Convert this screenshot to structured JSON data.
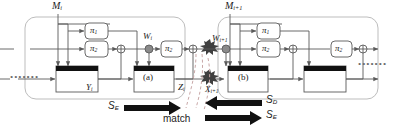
{
  "figure": {
    "type": "block-diagram",
    "colors": {
      "line": "#5a5a5a",
      "block_fill": "#ffffff",
      "block_header": "#1a1a1a",
      "arrow_fill": "#111111",
      "burst": "#3a3a3a",
      "group_border": "#b9b9b9",
      "match_dash": "#c9a7a7",
      "text": "#1a1a1a"
    }
  },
  "stage_left": {
    "message_label": "M",
    "message_sub": "i",
    "perm_top": "π",
    "perm_top_sub": "1",
    "perm_mid": "π",
    "perm_mid_sub": "2",
    "perm_right": "π",
    "perm_right_sub": "2",
    "w_label": "W",
    "w_sub": "i",
    "y_label": "Y",
    "y_sub": "i",
    "z_label": "Z",
    "z_sub": "i",
    "inner_box_label": "(a)"
  },
  "stage_right": {
    "message_label": "M",
    "message_sub": "i+1",
    "perm_top": "π",
    "perm_top_sub": "1",
    "perm_mid": "π",
    "perm_mid_sub": "2",
    "perm_right": "π",
    "perm_right_sub": "2",
    "w_label": "W",
    "w_sub": "i+1",
    "x_label": "X",
    "x_sub": "i+1",
    "inner_box_label": "(b)"
  },
  "annotations": {
    "match": "match",
    "arrow_encrypt_left": "S",
    "arrow_encrypt_left_sub": "E",
    "arrow_decrypt": "S",
    "arrow_decrypt_sub": "D",
    "arrow_encrypt_right": "S",
    "arrow_encrypt_right_sub": "E"
  },
  "ellipsis": {
    "left": "•••••••",
    "right": "•••••••"
  }
}
